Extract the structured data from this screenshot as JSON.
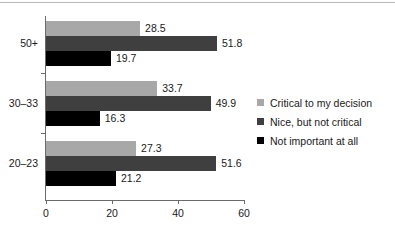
{
  "chart_data": {
    "type": "bar",
    "orientation": "horizontal",
    "title": "",
    "xlabel": "",
    "ylabel": "",
    "xlim": [
      0,
      60
    ],
    "xticks": [
      0,
      20,
      40,
      60
    ],
    "xticklabels": [
      "0",
      "20",
      "40",
      "60"
    ],
    "categories": [
      "50+",
      "30–33",
      "20–23"
    ],
    "grid": false,
    "legend_position": "right",
    "series": [
      {
        "name": "Critical to my decision",
        "color": "#a8a8a8",
        "values": [
          28.5,
          33.7,
          27.3
        ],
        "labels": [
          "28.5",
          "33.7",
          "27.3"
        ]
      },
      {
        "name": "Nice, but not critical",
        "color": "#3f3f3f",
        "values": [
          51.8,
          49.9,
          51.6
        ],
        "labels": [
          "51.8",
          "49.9",
          "51.6"
        ]
      },
      {
        "name": "Not important at all",
        "color": "#000000",
        "values": [
          19.7,
          16.3,
          21.2
        ],
        "labels": [
          "19.7",
          "16.3",
          "21.2"
        ]
      }
    ]
  },
  "legend": {
    "items": [
      {
        "label": "Critical to my decision"
      },
      {
        "label": "Nice, but not critical"
      },
      {
        "label": "Not important at all"
      }
    ]
  },
  "axis": {
    "x_tick_labels": [
      "0",
      "20",
      "40",
      "60"
    ],
    "y_tick_labels": [
      "50+",
      "30–33",
      "20–23"
    ]
  }
}
